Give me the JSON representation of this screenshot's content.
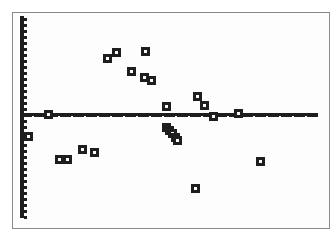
{
  "screen": {
    "device": "graphing calculator plot screen"
  },
  "colors": {
    "ink": "#1e1e1e",
    "background": "#fdfdfd",
    "frame": "#8a8a8a"
  },
  "chart_data": {
    "type": "scatter",
    "title": "",
    "xlabel": "",
    "ylabel": "",
    "grid": false,
    "marker": "hollow-square",
    "axes": {
      "x_axis_pixel_y": 115,
      "y_axis_pixel_x": 22,
      "x_pixel_range": [
        22,
        318
      ],
      "y_pixel_range": [
        16,
        218
      ]
    },
    "points_pixel": [
      [
        28,
        136
      ],
      [
        48,
        114
      ],
      [
        59,
        159
      ],
      [
        67,
        159
      ],
      [
        82,
        149
      ],
      [
        94,
        152
      ],
      [
        107,
        58
      ],
      [
        116,
        52
      ],
      [
        131,
        71
      ],
      [
        145,
        51
      ],
      [
        144,
        77
      ],
      [
        151,
        80
      ],
      [
        166,
        106
      ],
      [
        166,
        127
      ],
      [
        169,
        130
      ],
      [
        172,
        133
      ],
      [
        175,
        137
      ],
      [
        177,
        140
      ],
      [
        197,
        96
      ],
      [
        204,
        105
      ],
      [
        213,
        116
      ],
      [
        238,
        113
      ],
      [
        260,
        161
      ],
      [
        195,
        188
      ]
    ]
  }
}
